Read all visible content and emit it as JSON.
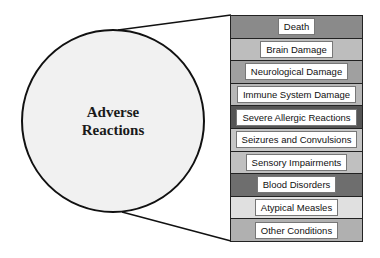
{
  "diagram": {
    "circle": {
      "label": "Adverse\nReactions",
      "fill": "#f1f1f1"
    },
    "rows": [
      {
        "label": "Death",
        "color": "#8a8a8a"
      },
      {
        "label": "Brain Damage",
        "color": "#bdbdbd"
      },
      {
        "label": "Neurological Damage",
        "color": "#a0a0a0"
      },
      {
        "label": "Immune System Damage",
        "color": "#b8b8b8"
      },
      {
        "label": "Severe Allergic Reactions",
        "color": "#555555"
      },
      {
        "label": "Seizures and Convulsions",
        "color": "#c6c6c6"
      },
      {
        "label": "Sensory Impairments",
        "color": "#c0c0c0"
      },
      {
        "label": "Blood Disorders",
        "color": "#6e6e6e"
      },
      {
        "label": "Atypical Measles",
        "color": "#e0e0e0"
      },
      {
        "label": "Other Conditions",
        "color": "#b0b0b0"
      }
    ]
  }
}
